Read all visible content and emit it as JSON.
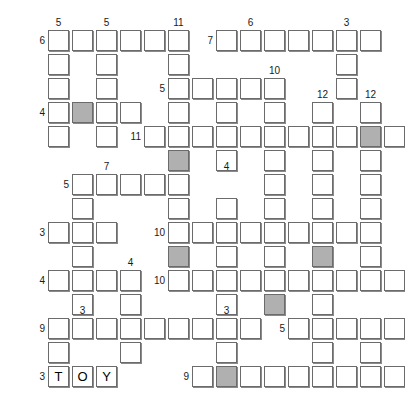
{
  "puzzle": {
    "title": "Crossword Grid",
    "type": "crossword",
    "grid_columns": 16,
    "grid_rows": 15,
    "cell_size": 21,
    "cell_pitch": 24,
    "origin_x": 24,
    "origin_y": 30,
    "colors": {
      "cell_fill": "#ffffff",
      "cell_border": "#6b6b6b",
      "cell_shadow": "#8a8a8a",
      "shaded_fill": "#b0b0b0",
      "background": "#ffffff",
      "text": "#000000",
      "clue_number": "#1a1a1a"
    },
    "cells": [
      {
        "r": 0,
        "c": 1,
        "letter": "",
        "shaded": false
      },
      {
        "r": 0,
        "c": 2,
        "letter": "",
        "shaded": false
      },
      {
        "r": 0,
        "c": 3,
        "letter": "",
        "shaded": false
      },
      {
        "r": 0,
        "c": 4,
        "letter": "",
        "shaded": false
      },
      {
        "r": 0,
        "c": 5,
        "letter": "",
        "shaded": false
      },
      {
        "r": 0,
        "c": 6,
        "letter": "",
        "shaded": false
      },
      {
        "r": 0,
        "c": 8,
        "letter": "",
        "shaded": false
      },
      {
        "r": 0,
        "c": 9,
        "letter": "",
        "shaded": false
      },
      {
        "r": 0,
        "c": 10,
        "letter": "",
        "shaded": false
      },
      {
        "r": 0,
        "c": 11,
        "letter": "",
        "shaded": false
      },
      {
        "r": 0,
        "c": 12,
        "letter": "",
        "shaded": false
      },
      {
        "r": 0,
        "c": 13,
        "letter": "",
        "shaded": false
      },
      {
        "r": 0,
        "c": 14,
        "letter": "",
        "shaded": false
      },
      {
        "r": 1,
        "c": 1,
        "letter": "",
        "shaded": false
      },
      {
        "r": 1,
        "c": 3,
        "letter": "",
        "shaded": false
      },
      {
        "r": 1,
        "c": 6,
        "letter": "",
        "shaded": false
      },
      {
        "r": 1,
        "c": 13,
        "letter": "",
        "shaded": false
      },
      {
        "r": 2,
        "c": 1,
        "letter": "",
        "shaded": false
      },
      {
        "r": 2,
        "c": 3,
        "letter": "",
        "shaded": false
      },
      {
        "r": 2,
        "c": 6,
        "letter": "",
        "shaded": false
      },
      {
        "r": 2,
        "c": 7,
        "letter": "",
        "shaded": false
      },
      {
        "r": 2,
        "c": 8,
        "letter": "",
        "shaded": false
      },
      {
        "r": 2,
        "c": 9,
        "letter": "",
        "shaded": false
      },
      {
        "r": 2,
        "c": 10,
        "letter": "",
        "shaded": false
      },
      {
        "r": 2,
        "c": 13,
        "letter": "",
        "shaded": false
      },
      {
        "r": 3,
        "c": 1,
        "letter": "",
        "shaded": false
      },
      {
        "r": 3,
        "c": 2,
        "letter": "",
        "shaded": true
      },
      {
        "r": 3,
        "c": 3,
        "letter": "",
        "shaded": false
      },
      {
        "r": 3,
        "c": 4,
        "letter": "",
        "shaded": false
      },
      {
        "r": 3,
        "c": 6,
        "letter": "",
        "shaded": false
      },
      {
        "r": 3,
        "c": 8,
        "letter": "",
        "shaded": false
      },
      {
        "r": 3,
        "c": 10,
        "letter": "",
        "shaded": false
      },
      {
        "r": 3,
        "c": 12,
        "letter": "",
        "shaded": false
      },
      {
        "r": 3,
        "c": 14,
        "letter": "",
        "shaded": false
      },
      {
        "r": 4,
        "c": 1,
        "letter": "",
        "shaded": false
      },
      {
        "r": 4,
        "c": 3,
        "letter": "",
        "shaded": false
      },
      {
        "r": 4,
        "c": 5,
        "letter": "",
        "shaded": false
      },
      {
        "r": 4,
        "c": 6,
        "letter": "",
        "shaded": false
      },
      {
        "r": 4,
        "c": 7,
        "letter": "",
        "shaded": false
      },
      {
        "r": 4,
        "c": 8,
        "letter": "",
        "shaded": false
      },
      {
        "r": 4,
        "c": 9,
        "letter": "",
        "shaded": false
      },
      {
        "r": 4,
        "c": 10,
        "letter": "",
        "shaded": false
      },
      {
        "r": 4,
        "c": 11,
        "letter": "",
        "shaded": false
      },
      {
        "r": 4,
        "c": 12,
        "letter": "",
        "shaded": false
      },
      {
        "r": 4,
        "c": 13,
        "letter": "",
        "shaded": false
      },
      {
        "r": 4,
        "c": 14,
        "letter": "",
        "shaded": true
      },
      {
        "r": 4,
        "c": 15,
        "letter": "",
        "shaded": false
      },
      {
        "r": 5,
        "c": 6,
        "letter": "",
        "shaded": true
      },
      {
        "r": 5,
        "c": 8,
        "letter": "",
        "shaded": false
      },
      {
        "r": 5,
        "c": 10,
        "letter": "",
        "shaded": false
      },
      {
        "r": 5,
        "c": 12,
        "letter": "",
        "shaded": false
      },
      {
        "r": 5,
        "c": 14,
        "letter": "",
        "shaded": false
      },
      {
        "r": 6,
        "c": 2,
        "letter": "",
        "shaded": false
      },
      {
        "r": 6,
        "c": 3,
        "letter": "",
        "shaded": false
      },
      {
        "r": 6,
        "c": 4,
        "letter": "",
        "shaded": false
      },
      {
        "r": 6,
        "c": 5,
        "letter": "",
        "shaded": false
      },
      {
        "r": 6,
        "c": 6,
        "letter": "",
        "shaded": false
      },
      {
        "r": 6,
        "c": 10,
        "letter": "",
        "shaded": false
      },
      {
        "r": 6,
        "c": 12,
        "letter": "",
        "shaded": false
      },
      {
        "r": 6,
        "c": 14,
        "letter": "",
        "shaded": false
      },
      {
        "r": 7,
        "c": 2,
        "letter": "",
        "shaded": false
      },
      {
        "r": 7,
        "c": 6,
        "letter": "",
        "shaded": false
      },
      {
        "r": 7,
        "c": 8,
        "letter": "",
        "shaded": false
      },
      {
        "r": 7,
        "c": 10,
        "letter": "",
        "shaded": false
      },
      {
        "r": 7,
        "c": 12,
        "letter": "",
        "shaded": false
      },
      {
        "r": 7,
        "c": 14,
        "letter": "",
        "shaded": false
      },
      {
        "r": 8,
        "c": 1,
        "letter": "",
        "shaded": false
      },
      {
        "r": 8,
        "c": 2,
        "letter": "",
        "shaded": false
      },
      {
        "r": 8,
        "c": 3,
        "letter": "",
        "shaded": false
      },
      {
        "r": 8,
        "c": 6,
        "letter": "",
        "shaded": false
      },
      {
        "r": 8,
        "c": 7,
        "letter": "",
        "shaded": false
      },
      {
        "r": 8,
        "c": 8,
        "letter": "",
        "shaded": false
      },
      {
        "r": 8,
        "c": 9,
        "letter": "",
        "shaded": false
      },
      {
        "r": 8,
        "c": 10,
        "letter": "",
        "shaded": false
      },
      {
        "r": 8,
        "c": 11,
        "letter": "",
        "shaded": false
      },
      {
        "r": 8,
        "c": 12,
        "letter": "",
        "shaded": false
      },
      {
        "r": 8,
        "c": 13,
        "letter": "",
        "shaded": false
      },
      {
        "r": 8,
        "c": 14,
        "letter": "",
        "shaded": false
      },
      {
        "r": 9,
        "c": 2,
        "letter": "",
        "shaded": false
      },
      {
        "r": 9,
        "c": 6,
        "letter": "",
        "shaded": true
      },
      {
        "r": 9,
        "c": 8,
        "letter": "",
        "shaded": false
      },
      {
        "r": 9,
        "c": 10,
        "letter": "",
        "shaded": false
      },
      {
        "r": 9,
        "c": 12,
        "letter": "",
        "shaded": true
      },
      {
        "r": 9,
        "c": 14,
        "letter": "",
        "shaded": false
      },
      {
        "r": 10,
        "c": 1,
        "letter": "",
        "shaded": false
      },
      {
        "r": 10,
        "c": 2,
        "letter": "",
        "shaded": false
      },
      {
        "r": 10,
        "c": 3,
        "letter": "",
        "shaded": false
      },
      {
        "r": 10,
        "c": 4,
        "letter": "",
        "shaded": false
      },
      {
        "r": 10,
        "c": 6,
        "letter": "",
        "shaded": false
      },
      {
        "r": 10,
        "c": 7,
        "letter": "",
        "shaded": false
      },
      {
        "r": 10,
        "c": 8,
        "letter": "",
        "shaded": false
      },
      {
        "r": 10,
        "c": 9,
        "letter": "",
        "shaded": false
      },
      {
        "r": 10,
        "c": 10,
        "letter": "",
        "shaded": false
      },
      {
        "r": 10,
        "c": 11,
        "letter": "",
        "shaded": false
      },
      {
        "r": 10,
        "c": 12,
        "letter": "",
        "shaded": false
      },
      {
        "r": 10,
        "c": 13,
        "letter": "",
        "shaded": false
      },
      {
        "r": 10,
        "c": 14,
        "letter": "",
        "shaded": false
      },
      {
        "r": 10,
        "c": 15,
        "letter": "",
        "shaded": false
      },
      {
        "r": 11,
        "c": 2,
        "letter": "",
        "shaded": false
      },
      {
        "r": 11,
        "c": 4,
        "letter": "",
        "shaded": false
      },
      {
        "r": 11,
        "c": 8,
        "letter": "",
        "shaded": false
      },
      {
        "r": 11,
        "c": 10,
        "letter": "",
        "shaded": true
      },
      {
        "r": 11,
        "c": 12,
        "letter": "",
        "shaded": false
      },
      {
        "r": 12,
        "c": 1,
        "letter": "",
        "shaded": false
      },
      {
        "r": 12,
        "c": 2,
        "letter": "",
        "shaded": false
      },
      {
        "r": 12,
        "c": 3,
        "letter": "",
        "shaded": false
      },
      {
        "r": 12,
        "c": 4,
        "letter": "",
        "shaded": false
      },
      {
        "r": 12,
        "c": 5,
        "letter": "",
        "shaded": false
      },
      {
        "r": 12,
        "c": 6,
        "letter": "",
        "shaded": false
      },
      {
        "r": 12,
        "c": 7,
        "letter": "",
        "shaded": false
      },
      {
        "r": 12,
        "c": 8,
        "letter": "",
        "shaded": false
      },
      {
        "r": 12,
        "c": 9,
        "letter": "",
        "shaded": false
      },
      {
        "r": 12,
        "c": 11,
        "letter": "",
        "shaded": false
      },
      {
        "r": 12,
        "c": 12,
        "letter": "",
        "shaded": false
      },
      {
        "r": 12,
        "c": 13,
        "letter": "",
        "shaded": false
      },
      {
        "r": 12,
        "c": 14,
        "letter": "",
        "shaded": false
      },
      {
        "r": 12,
        "c": 15,
        "letter": "",
        "shaded": false
      },
      {
        "r": 13,
        "c": 1,
        "letter": "",
        "shaded": false
      },
      {
        "r": 13,
        "c": 4,
        "letter": "",
        "shaded": false
      },
      {
        "r": 13,
        "c": 8,
        "letter": "",
        "shaded": false
      },
      {
        "r": 13,
        "c": 12,
        "letter": "",
        "shaded": false
      },
      {
        "r": 13,
        "c": 14,
        "letter": "",
        "shaded": false
      },
      {
        "r": 14,
        "c": 1,
        "letter": "T",
        "shaded": false
      },
      {
        "r": 14,
        "c": 2,
        "letter": "O",
        "shaded": false
      },
      {
        "r": 14,
        "c": 3,
        "letter": "Y",
        "shaded": false
      },
      {
        "r": 14,
        "c": 7,
        "letter": "",
        "shaded": false
      },
      {
        "r": 14,
        "c": 8,
        "letter": "",
        "shaded": true
      },
      {
        "r": 14,
        "c": 9,
        "letter": "",
        "shaded": false
      },
      {
        "r": 14,
        "c": 10,
        "letter": "",
        "shaded": false
      },
      {
        "r": 14,
        "c": 11,
        "letter": "",
        "shaded": false
      },
      {
        "r": 14,
        "c": 12,
        "letter": "",
        "shaded": false
      },
      {
        "r": 14,
        "c": 13,
        "letter": "",
        "shaded": false
      },
      {
        "r": 14,
        "c": 14,
        "letter": "",
        "shaded": false
      },
      {
        "r": 14,
        "c": 15,
        "letter": "",
        "shaded": false
      }
    ],
    "clue_numbers": [
      {
        "text": "5",
        "r": 0,
        "c": 1,
        "pos": "above"
      },
      {
        "text": "5",
        "r": 0,
        "c": 3,
        "pos": "above"
      },
      {
        "text": "11",
        "r": 0,
        "c": 6,
        "pos": "above"
      },
      {
        "text": "6",
        "r": 0,
        "c": 9,
        "pos": "above"
      },
      {
        "text": "3",
        "r": 0,
        "c": 13,
        "pos": "above"
      },
      {
        "text": "6",
        "r": 0,
        "c": 1,
        "pos": "left"
      },
      {
        "text": "7",
        "r": 0,
        "c": 8,
        "pos": "left"
      },
      {
        "text": "10",
        "r": 2,
        "c": 10,
        "pos": "above"
      },
      {
        "text": "5",
        "r": 2,
        "c": 6,
        "pos": "left"
      },
      {
        "text": "12",
        "r": 3,
        "c": 12,
        "pos": "above"
      },
      {
        "text": "12",
        "r": 3,
        "c": 14,
        "pos": "above"
      },
      {
        "text": "4",
        "r": 3,
        "c": 1,
        "pos": "left"
      },
      {
        "text": "11",
        "r": 4,
        "c": 5,
        "pos": "left"
      },
      {
        "text": "7",
        "r": 6,
        "c": 3,
        "pos": "above"
      },
      {
        "text": "4",
        "r": 6,
        "c": 8,
        "pos": "above"
      },
      {
        "text": "5",
        "r": 6,
        "c": 2,
        "pos": "left"
      },
      {
        "text": "3",
        "r": 8,
        "c": 1,
        "pos": "left"
      },
      {
        "text": "10",
        "r": 8,
        "c": 6,
        "pos": "left"
      },
      {
        "text": "4",
        "r": 10,
        "c": 4,
        "pos": "above"
      },
      {
        "text": "4",
        "r": 10,
        "c": 1,
        "pos": "left"
      },
      {
        "text": "10",
        "r": 10,
        "c": 6,
        "pos": "left"
      },
      {
        "text": "3",
        "r": 12,
        "c": 2,
        "pos": "above"
      },
      {
        "text": "3",
        "r": 12,
        "c": 8,
        "pos": "above"
      },
      {
        "text": "9",
        "r": 12,
        "c": 1,
        "pos": "left"
      },
      {
        "text": "5",
        "r": 12,
        "c": 11,
        "pos": "left"
      },
      {
        "text": "3",
        "r": 14,
        "c": 1,
        "pos": "left"
      },
      {
        "text": "9",
        "r": 14,
        "c": 7,
        "pos": "left"
      }
    ]
  }
}
